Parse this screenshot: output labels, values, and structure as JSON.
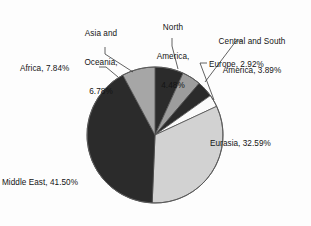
{
  "chart_data": {
    "type": "pie",
    "title": "",
    "subtitle": "",
    "xlabel": "",
    "ylabel": "",
    "legend_position": "none",
    "grid": false,
    "units": "percent",
    "total": 100.0,
    "start_angle_deg": 0,
    "direction": "clockwise",
    "categories": [
      "Asia and Oceania",
      "North America",
      "Central and South America",
      "Europe",
      "Eurasia",
      "Middle East",
      "Africa"
    ],
    "values": [
      6.78,
      4.48,
      3.89,
      2.92,
      32.59,
      41.5,
      7.84
    ],
    "slices": [
      {
        "name": "Asia and Oceania",
        "value": 6.78,
        "value_text": "6.78%",
        "label_text": "Asia and Oceania,\n6.78%",
        "color": "#2b2b2b",
        "start_angle_deg": 0.0,
        "end_angle_deg": 24.408
      },
      {
        "name": "North America",
        "value": 4.48,
        "value_text": "4.48%",
        "label_text": "North\nAmerica,\n4.48%",
        "color": "#9d9d9d",
        "start_angle_deg": 24.408,
        "end_angle_deg": 40.536
      },
      {
        "name": "Central and South America",
        "value": 3.89,
        "value_text": "3.89%",
        "label_text": "Central and South\nAmerica, 3.89%",
        "color": "#2b2b2b",
        "start_angle_deg": 40.536,
        "end_angle_deg": 54.54
      },
      {
        "name": "Europe",
        "value": 2.92,
        "value_text": "2.92%",
        "label_text": "Europe, 2.92%",
        "color": "#fbfbfb",
        "start_angle_deg": 54.54,
        "end_angle_deg": 65.052
      },
      {
        "name": "Eurasia",
        "value": 32.59,
        "value_text": "32.59%",
        "label_text": "Eurasia, 32.59%",
        "color": "#d2d2d2",
        "start_angle_deg": 65.052,
        "end_angle_deg": 182.376
      },
      {
        "name": "Middle East",
        "value": 41.5,
        "value_text": "41.50%",
        "label_text": "Middle East, 41.50%",
        "color": "#2b2b2b",
        "start_angle_deg": 182.376,
        "end_angle_deg": 331.776
      },
      {
        "name": "Africa",
        "value": 7.84,
        "value_text": "7.84%",
        "label_text": "Africa, 7.84%",
        "color": "#a6a6a6",
        "start_angle_deg": 331.776,
        "end_angle_deg": 360.0
      }
    ]
  },
  "labels": {
    "asia_oceania_line1": "Asia and",
    "asia_oceania_line2": "Oceania,",
    "asia_oceania_line3": "6.78%",
    "north_america_line1": "North",
    "north_america_line2": "America,",
    "north_america_line3": "4.48%",
    "central_south_line1": "Central and South",
    "central_south_line2": "America, 3.89%",
    "europe": "Europe, 2.92%",
    "eurasia": "Eurasia, 32.59%",
    "middle_east": "Middle East, 41.50%",
    "africa": "Africa, 7.84%"
  },
  "colors": {
    "dark": "#2b2b2b",
    "medium_gray": "#a6a6a6",
    "light_gray": "#d2d2d2",
    "white": "#fbfbfb",
    "outline": "#5a5a5a",
    "text": "#141414",
    "background": "#fdfdfd"
  }
}
